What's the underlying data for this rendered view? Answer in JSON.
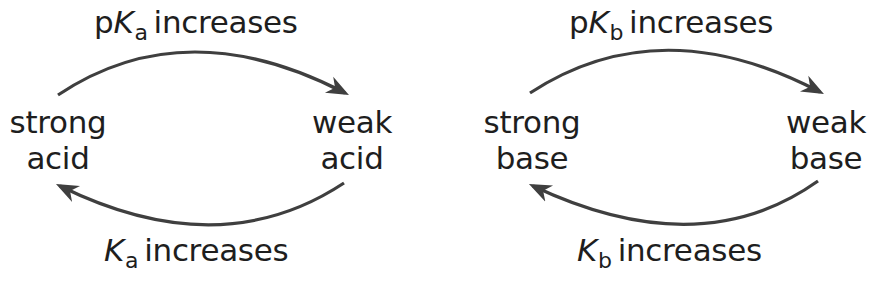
{
  "arrow_color": "#3f3f3f",
  "acid_diagram": {
    "top_label": {
      "prefix": "p",
      "symbol": "K",
      "subscript": "a",
      "text": "increases"
    },
    "bottom_label": {
      "prefix": "",
      "symbol": "K",
      "subscript": "a",
      "text": "increases"
    },
    "left_node": {
      "line1": "strong",
      "line2": "acid"
    },
    "right_node": {
      "line1": "weak",
      "line2": "acid"
    }
  },
  "base_diagram": {
    "top_label": {
      "prefix": "p",
      "symbol": "K",
      "subscript": "b",
      "text": "increases"
    },
    "bottom_label": {
      "prefix": "",
      "symbol": "K",
      "subscript": "b",
      "text": "increases"
    },
    "left_node": {
      "line1": "strong",
      "line2": "base"
    },
    "right_node": {
      "line1": "weak",
      "line2": "base"
    }
  }
}
